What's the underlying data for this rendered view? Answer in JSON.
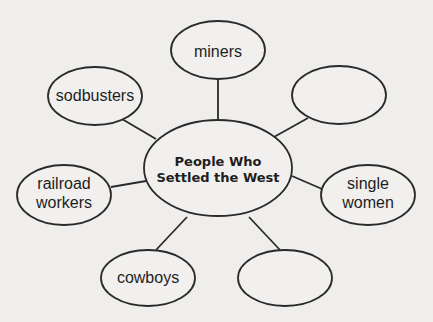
{
  "diagram": {
    "type": "concept-web",
    "center": {
      "line1": "People Who",
      "line2": "Settled the West"
    },
    "nodes": [
      {
        "id": "miners",
        "line1": "miners",
        "line2": ""
      },
      {
        "id": "sodbusters",
        "line1": "sodbusters",
        "line2": ""
      },
      {
        "id": "blank-top-right",
        "line1": "",
        "line2": ""
      },
      {
        "id": "railroad-workers",
        "line1": "railroad",
        "line2": "workers"
      },
      {
        "id": "single-women",
        "line1": "single",
        "line2": "women"
      },
      {
        "id": "cowboys",
        "line1": "cowboys",
        "line2": ""
      },
      {
        "id": "blank-bottom-right",
        "line1": "",
        "line2": ""
      }
    ]
  }
}
